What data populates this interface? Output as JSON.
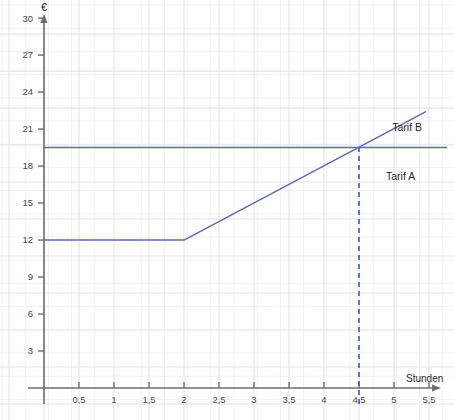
{
  "chart_data": {
    "type": "line",
    "title": "",
    "subtitle": "",
    "xlabel": "Stunden",
    "ylabel": "€",
    "xlim": [
      0,
      5.75
    ],
    "ylim": [
      0,
      31.5
    ],
    "grid": true,
    "legend_position": "inline-right",
    "x_ticks": [
      0.5,
      1,
      1.5,
      2,
      2.5,
      3,
      3.5,
      4,
      4.5,
      5,
      5.5
    ],
    "x_tick_labels": [
      "0,5",
      "1",
      "1,5",
      "2",
      "2,5",
      "3",
      "3,5",
      "4",
      "4,5",
      "5",
      "5,5"
    ],
    "y_ticks": [
      3,
      6,
      9,
      12,
      15,
      18,
      21,
      24,
      27,
      30
    ],
    "y_tick_labels": [
      "3",
      "6",
      "9",
      "12",
      "15",
      "18",
      "21",
      "24",
      "27",
      "30"
    ],
    "series": [
      {
        "name": "Tarif A",
        "label": "Tarif A",
        "color": "#5a6bb0",
        "points": [
          [
            0,
            19.5
          ],
          [
            5.75,
            19.5
          ]
        ],
        "description": "Konstante Gebuehr 19,50 € unabhaengig von der Stundenzahl"
      },
      {
        "name": "Tarif B",
        "label": "Tarif B",
        "color": "#5a6bb0",
        "points": [
          [
            0,
            12
          ],
          [
            2,
            12
          ],
          [
            5.45,
            22.4
          ]
        ],
        "description": "Grundgebuehr 12 € bis 2 Stunden, danach 3 € je weitere Stunde"
      }
    ],
    "annotations": [
      {
        "type": "dashed-vertical",
        "name": "intersection-dropline",
        "x": 4.5,
        "y_from": 0,
        "y_to": 19.5,
        "color": "#3b5bb5",
        "dash": "5,4"
      }
    ],
    "intersection": {
      "x": 4.5,
      "y": 19.5,
      "x_label": "4,5",
      "y_label": "19,5"
    },
    "axis_style": {
      "axis_color": "#6e6e6e",
      "grid_major_color": "#e4e4e8",
      "grid_minor_color": "#f1f1f4",
      "background": "#ffffff"
    }
  },
  "labels": {
    "y_axis_unit": "€",
    "x_axis_name": "Stunden",
    "tarif_a": "Tarif A",
    "tarif_b": "Tarif B"
  }
}
